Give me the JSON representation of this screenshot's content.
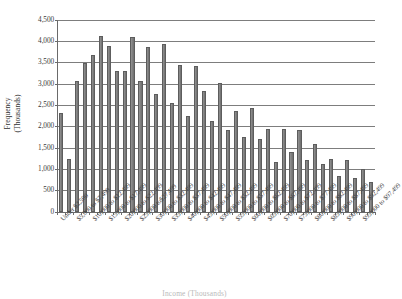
{
  "chart_data": {
    "type": "bar",
    "title": "",
    "subtitle": "",
    "xlabel": "Income (Thousands)",
    "ylabel": "Frequency\n(Thousands)",
    "ylim": [
      0,
      4500
    ],
    "ytick_step": 500,
    "yticks": [
      "4,500",
      "4,000",
      "3,500",
      "3,000",
      "2,500",
      "2,000",
      "1,500",
      "1,000",
      "500",
      "0"
    ],
    "ytick_values": [
      4500,
      4000,
      3500,
      3000,
      2500,
      2000,
      1500,
      1000,
      500,
      0
    ],
    "grid": true,
    "legend": false,
    "legend_position": "none",
    "bar_color": "#808080",
    "bar_edge_color": "#5d5d5d",
    "label_rotation": -45,
    "label_interval": 2,
    "categories": [
      "Under $2,500",
      "$2,500 to $4,999",
      "$5,000 to $7,499",
      "$7,500 to $9,999",
      "$10,000 to $12,499",
      "$12,500 to $14,999",
      "$15,000 to $17,499",
      "$17,500 to $19,999",
      "$20,000 to $22,499",
      "$22,500 to $24,999",
      "$25,000 to $27,499",
      "$27,500 to $29,999",
      "$30,000 to $32,499",
      "$32,500 to $34,999",
      "$35,000 to $37,499",
      "$37,500 to $39,999",
      "$40,000 to $42,499",
      "$42,500 to $44,999",
      "$45,000 to $47,499",
      "$47,500 to $49,999",
      "$50,000 to $52,499",
      "$52,500 to $54,999",
      "$55,000 to $57,499",
      "$57,500 to $59,999",
      "$60,000 to $62,499",
      "$62,500 to $64,999",
      "$65,000 to $67,499",
      "$67,500 to $69,999",
      "$70,000 to $72,499",
      "$72,500 to $74,999",
      "$75,000 to $77,499",
      "$77,500 to $79,999",
      "$80,000 to $82,499",
      "$82,500 to $84,999",
      "$85,000 to $87,499",
      "$87,500 to $89,999",
      "$90,000 to $92,499",
      "$92,500 to $94,999",
      "$95,000 to $97,499",
      "$97,500 to $99,999"
    ],
    "visible_tick_labels": [
      "Under $2,500",
      "$5,000 to $7,499",
      "$10,000 to $12,499",
      "$15,000 to $17,499",
      "$20,000 to $22,499",
      "$25,000 to$27,499",
      "$30,000 to $32,499",
      "$35,000 to $37,499",
      "$40,000 to $42,499",
      "$45,000 to $47,499",
      "$50,000 to $52,499",
      "$55,000 to $57,499",
      "$60,000 to $62,499",
      "$65,000 to $67,499",
      "$70,000 to $72,499",
      "$75,000 to $77,499",
      "$80,000 to $82,499",
      "$85,000 to $87,499",
      "$90,000 to $92,499",
      "$95,000 to $97,499"
    ],
    "values": [
      2300,
      1220,
      3050,
      3490,
      3680,
      4120,
      3890,
      3300,
      3290,
      4100,
      3050,
      3850,
      2760,
      3920,
      2550,
      3440,
      2230,
      3420,
      2820,
      2120,
      3020,
      1910,
      2360,
      1740,
      2430,
      1710,
      1930,
      1170,
      1940,
      1400,
      1920,
      1200,
      1580,
      1120,
      1230,
      830,
      1200,
      790,
      990,
      690
    ]
  }
}
